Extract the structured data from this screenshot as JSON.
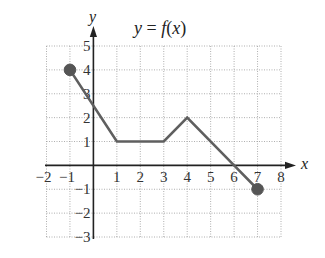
{
  "chart_data": {
    "type": "line",
    "title": "y = f(x)",
    "title_parts": {
      "lhs": "y",
      "eq": " = ",
      "fn": "f",
      "open": "(",
      "arg": "x",
      "close": ")"
    },
    "xlabel": "x",
    "ylabel": "y",
    "xlim": [
      -2,
      8
    ],
    "ylim": [
      -3,
      5
    ],
    "grid": true,
    "grid_style": "dotted",
    "legend": null,
    "x_ticks": [
      -2,
      -1,
      1,
      2,
      3,
      4,
      5,
      6,
      7,
      8
    ],
    "x_tick_labels": [
      "−2",
      "−1",
      "1",
      "2",
      "3",
      "4",
      "5",
      "6",
      "7",
      "8"
    ],
    "y_ticks": [
      5,
      4,
      3,
      2,
      1,
      -1,
      -2,
      -3
    ],
    "y_tick_labels": [
      "5",
      "4",
      "3",
      "2",
      "1",
      "−1",
      "−2",
      "−3"
    ],
    "series": [
      {
        "name": "f(x)",
        "x": [
          -1,
          1,
          3,
          4,
          6,
          7
        ],
        "y": [
          4,
          1,
          1,
          2,
          0,
          -1
        ],
        "color": "#5f5f5f",
        "endpoints": [
          {
            "x": -1,
            "y": 4,
            "closed": true
          },
          {
            "x": 7,
            "y": -1,
            "closed": true
          }
        ]
      }
    ]
  },
  "colors": {
    "line": "#5f5f5f",
    "dot": "#555555",
    "axis": "#222222",
    "grid": "#9a9a9a",
    "background": "#ffffff"
  },
  "layout": {
    "plot_left_px": 46.5,
    "plot_right_px": 281,
    "plot_top_px": 46,
    "plot_bottom_px": 237,
    "x_axis_left_px": 45,
    "x_axis_arrow_tip_px": 296,
    "y_axis_bottom_px": 239,
    "y_axis_arrow_tip_px": 26,
    "dot_radius_px": 5.8
  }
}
